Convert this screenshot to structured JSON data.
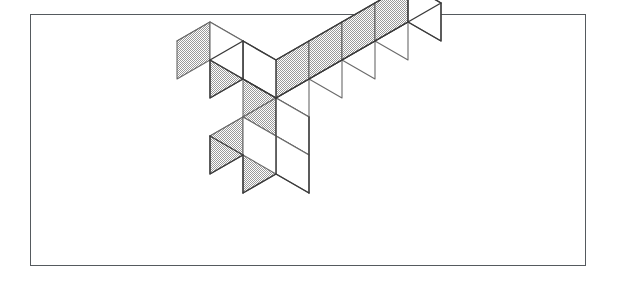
{
  "figure": {
    "kind": "polycube-isometric-line-drawing",
    "cube_count": 9,
    "frame": {
      "x": 30,
      "y": 14,
      "width": 556,
      "height": 252,
      "border_color": "#555a5e",
      "border_width": 1.4,
      "fill": "#ffffff"
    },
    "projection": {
      "half_width": 33,
      "half_depth_rise": 19,
      "face_height": 38,
      "origin_x": 276,
      "origin_y": 98
    },
    "colors": {
      "outline": "#3a3a3a",
      "inner_line": "#6a6a6a",
      "face_top": "#ffffff",
      "face_right": "#ffffff",
      "face_left": "#d2d2d2",
      "background": "#ffffff"
    },
    "arms": [
      {
        "name": "back-right-arm",
        "direction": "+u (right-back)",
        "cubes": 5
      },
      {
        "name": "back-left-arm",
        "direction": "+v (left-back)",
        "cubes": 2
      },
      {
        "name": "downward-column",
        "direction": "-z (down)",
        "cubes": 3
      }
    ],
    "cells": [
      {
        "u": 0,
        "v": 0,
        "z": 0
      },
      {
        "u": 1,
        "v": 0,
        "z": 0
      },
      {
        "u": 2,
        "v": 0,
        "z": 0
      },
      {
        "u": 3,
        "v": 0,
        "z": 0
      },
      {
        "u": 4,
        "v": 0,
        "z": 0
      },
      {
        "u": 0,
        "v": 1,
        "z": 0
      },
      {
        "u": 0,
        "v": 2,
        "z": 0
      },
      {
        "u": 0,
        "v": 0,
        "z": -1
      },
      {
        "u": 0,
        "v": 0,
        "z": -2
      },
      {
        "u": 0,
        "v": 1,
        "z": -2
      }
    ]
  }
}
